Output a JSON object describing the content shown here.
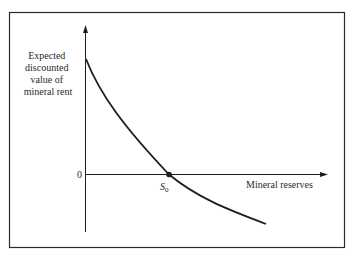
{
  "diagram": {
    "y_axis_label_lines": [
      "Expected",
      "discounted",
      "value of",
      "mineral rent"
    ],
    "x_axis_label": "Mineral reserves",
    "origin_label": "0",
    "point_label": "S",
    "point_label_subscript": "0",
    "colors": {
      "line": "#1e1e1e",
      "frame": "#2a2a2a",
      "text": "#2a2a2a",
      "background": "#ffffff"
    }
  }
}
